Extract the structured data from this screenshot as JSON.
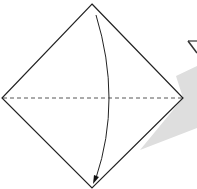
{
  "diagram": {
    "type": "origami-fold-step",
    "shapes": {
      "square": "diamond-oriented paper square",
      "valley_fold_line": "horizontal dashed line through center",
      "fold_arrow": "curved arrow from top corner down to bottom corner",
      "shadow_band": "light gray wedge extending right",
      "next_step_triangle": "partial triangle at top-right edge"
    },
    "colors": {
      "line": "#222222",
      "shadow": "#dcdcdc",
      "background": "#ffffff"
    }
  }
}
